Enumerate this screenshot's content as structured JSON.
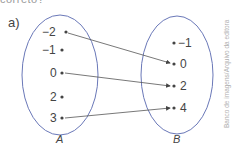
{
  "header": {
    "cut_text": "correto?"
  },
  "exercise": {
    "label": "a)",
    "set_a": {
      "name": "A",
      "elements": [
        "−2",
        "−1",
        "0",
        "2",
        "3"
      ]
    },
    "set_b": {
      "name": "B",
      "elements": [
        "−1",
        "0",
        "2",
        "4"
      ]
    },
    "mappings": [
      {
        "from": "−2",
        "to": "0"
      },
      {
        "from": "0",
        "to": "2"
      },
      {
        "from": "3",
        "to": "4"
      }
    ],
    "colors": {
      "ellipse": "#6a78b8",
      "arrow": "#444444",
      "text": "#444444"
    }
  },
  "credit": "Banco de imagens/Arquivo da editora"
}
